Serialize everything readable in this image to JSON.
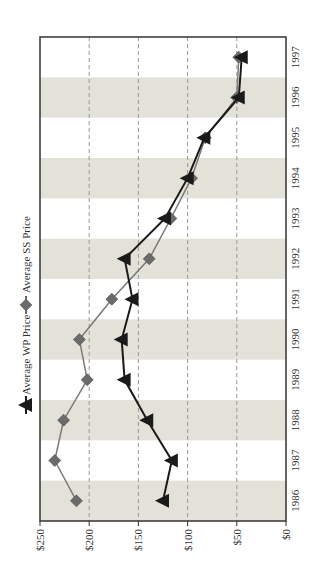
{
  "chart_data": {
    "type": "line",
    "orientation": "rotated-90-clockwise",
    "title": "",
    "xlabel": "",
    "ylabel": "",
    "categories": [
      "1986",
      "1987",
      "1988",
      "1989",
      "1990",
      "1991",
      "1992",
      "1993",
      "1994",
      "1995",
      "1996",
      "1997"
    ],
    "series": [
      {
        "name": "Average WP Price",
        "marker": "triangle",
        "color": "#1a1a1a",
        "values": [
          125,
          116,
          141,
          164,
          167,
          156,
          164,
          123,
          100,
          83,
          48,
          45
        ]
      },
      {
        "name": "Average SS Price",
        "marker": "diamond",
        "color": "#6b6b6b",
        "values": [
          213,
          235,
          226,
          202,
          210,
          177,
          139,
          117,
          96,
          82,
          50,
          48
        ]
      }
    ],
    "ylim": [
      0,
      250
    ],
    "yticks": [
      0,
      50,
      100,
      150,
      200,
      250
    ],
    "ytick_labels": [
      "$0",
      "$50",
      "$100",
      "$150",
      "$200",
      "$250"
    ],
    "grid": "dashed at $50 intervals",
    "alternating_bands": true,
    "band_color": "#e3e2d8",
    "legend_position": "left (rotated)"
  },
  "legend": {
    "wp_label": "Average WP Price",
    "ss_label": "Average SS Price"
  }
}
